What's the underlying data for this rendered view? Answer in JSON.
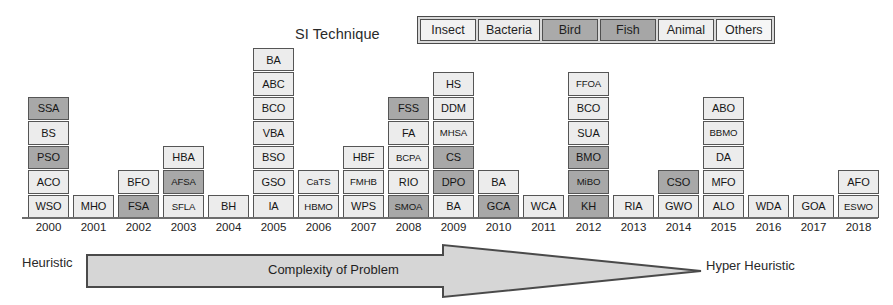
{
  "legend": {
    "title": "SI Technique",
    "items": [
      {
        "label": "Insect",
        "color": "#f2f2f2"
      },
      {
        "label": "Bacteria",
        "color": "#ededed"
      },
      {
        "label": "Bird",
        "color": "#aaaaaa"
      },
      {
        "label": "Fish",
        "color": "#a6a6a6"
      },
      {
        "label": "Animal",
        "color": "#efefef"
      },
      {
        "label": "Others",
        "color": "#f6f6f6"
      }
    ]
  },
  "axis": {
    "left_label": "Heuristic",
    "right_label": "Hyper Heuristic",
    "arrow_label": "Complexity of Problem"
  },
  "chart_data": {
    "type": "bar",
    "title": "SI Technique",
    "xlabel": "",
    "ylabel": "",
    "categories": [
      "2000",
      "2001",
      "2002",
      "2003",
      "2004",
      "2005",
      "2006",
      "2007",
      "2008",
      "2009",
      "2010",
      "2011",
      "2012",
      "2013",
      "2014",
      "2015",
      "2016",
      "2017",
      "2018"
    ],
    "values": [
      5,
      1,
      2,
      3,
      1,
      7,
      2,
      3,
      5,
      6,
      2,
      1,
      6,
      1,
      2,
      5,
      1,
      1,
      2
    ],
    "columns": [
      {
        "year": "2000",
        "cells": [
          {
            "label": "WSO",
            "shade": "light"
          },
          {
            "label": "ACO",
            "shade": "light"
          },
          {
            "label": "PSO",
            "shade": "dark"
          },
          {
            "label": "BS",
            "shade": "light"
          },
          {
            "label": "SSA",
            "shade": "dark"
          }
        ]
      },
      {
        "year": "2001",
        "cells": [
          {
            "label": "MHO",
            "shade": "light"
          }
        ]
      },
      {
        "year": "2002",
        "cells": [
          {
            "label": "FSA",
            "shade": "dark"
          },
          {
            "label": "BFO",
            "shade": "light"
          }
        ]
      },
      {
        "year": "2003",
        "cells": [
          {
            "label": "SFLA",
            "shade": "light"
          },
          {
            "label": "AFSA",
            "shade": "dark"
          },
          {
            "label": "HBA",
            "shade": "light"
          }
        ]
      },
      {
        "year": "2004",
        "cells": [
          {
            "label": "BH",
            "shade": "light"
          }
        ]
      },
      {
        "year": "2005",
        "cells": [
          {
            "label": "IA",
            "shade": "light"
          },
          {
            "label": "GSO",
            "shade": "light"
          },
          {
            "label": "BSO",
            "shade": "light"
          },
          {
            "label": "VBA",
            "shade": "light"
          },
          {
            "label": "BCO",
            "shade": "light"
          },
          {
            "label": "ABC",
            "shade": "light"
          },
          {
            "label": "BA",
            "shade": "light"
          }
        ]
      },
      {
        "year": "2006",
        "cells": [
          {
            "label": "HBMO",
            "shade": "light"
          },
          {
            "label": "CaTS",
            "shade": "light"
          }
        ]
      },
      {
        "year": "2007",
        "cells": [
          {
            "label": "WPS",
            "shade": "light"
          },
          {
            "label": "FMHB",
            "shade": "light"
          },
          {
            "label": "HBF",
            "shade": "light"
          }
        ]
      },
      {
        "year": "2008",
        "cells": [
          {
            "label": "SMOA",
            "shade": "dark"
          },
          {
            "label": "RIO",
            "shade": "light"
          },
          {
            "label": "BCPA",
            "shade": "light"
          },
          {
            "label": "FA",
            "shade": "light"
          },
          {
            "label": "FSS",
            "shade": "dark"
          }
        ]
      },
      {
        "year": "2009",
        "cells": [
          {
            "label": "BA",
            "shade": "light"
          },
          {
            "label": "DPO",
            "shade": "dark"
          },
          {
            "label": "CS",
            "shade": "dark"
          },
          {
            "label": "MHSA",
            "shade": "light"
          },
          {
            "label": "DDM",
            "shade": "light"
          },
          {
            "label": "HS",
            "shade": "light"
          }
        ]
      },
      {
        "year": "2010",
        "cells": [
          {
            "label": "GCA",
            "shade": "dark"
          },
          {
            "label": "BA",
            "shade": "light"
          }
        ]
      },
      {
        "year": "2011",
        "cells": [
          {
            "label": "WCA",
            "shade": "light"
          }
        ]
      },
      {
        "year": "2012",
        "cells": [
          {
            "label": "KH",
            "shade": "dark"
          },
          {
            "label": "MiBO",
            "shade": "dark"
          },
          {
            "label": "BMO",
            "shade": "dark"
          },
          {
            "label": "SUA",
            "shade": "light"
          },
          {
            "label": "BCO",
            "shade": "light"
          },
          {
            "label": "FFOA",
            "shade": "light"
          }
        ]
      },
      {
        "year": "2013",
        "cells": [
          {
            "label": "RIA",
            "shade": "light"
          }
        ]
      },
      {
        "year": "2014",
        "cells": [
          {
            "label": "GWO",
            "shade": "light"
          },
          {
            "label": "CSO",
            "shade": "dark"
          }
        ]
      },
      {
        "year": "2015",
        "cells": [
          {
            "label": "ALO",
            "shade": "light"
          },
          {
            "label": "MFO",
            "shade": "light"
          },
          {
            "label": "DA",
            "shade": "light"
          },
          {
            "label": "BBMO",
            "shade": "light"
          },
          {
            "label": "ABO",
            "shade": "light"
          }
        ]
      },
      {
        "year": "2016",
        "cells": [
          {
            "label": "WDA",
            "shade": "light"
          }
        ]
      },
      {
        "year": "2017",
        "cells": [
          {
            "label": "GOA",
            "shade": "light"
          }
        ]
      },
      {
        "year": "2018",
        "cells": [
          {
            "label": "ESWO",
            "shade": "light"
          },
          {
            "label": "AFO",
            "shade": "light"
          }
        ]
      }
    ]
  },
  "colors": {
    "light": "#ececec",
    "dark": "#a8a8a8",
    "border": "#555555",
    "arrow_fill": "#d6d6d6",
    "arrow_stroke": "#4a4a4a"
  }
}
